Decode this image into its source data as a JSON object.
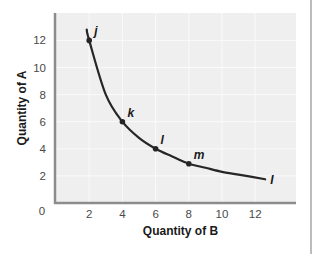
{
  "chart_data": {
    "type": "line",
    "title": "",
    "xlabel": "Quantity of B",
    "ylabel": "Quantity of A",
    "xlim": [
      0,
      14.5
    ],
    "ylim": [
      0,
      14
    ],
    "xticks": [
      2,
      4,
      6,
      8,
      10,
      12
    ],
    "xtick_labels": [
      "2",
      "4",
      "6",
      "8",
      "10",
      "12"
    ],
    "yticks": [
      2,
      4,
      6,
      8,
      10,
      12
    ],
    "ytick_labels": [
      "2",
      "4",
      "6",
      "8",
      "10",
      "12"
    ],
    "origin_label": "0",
    "grid": true,
    "series": [
      {
        "name": "I",
        "curve_label": "I",
        "x": [
          1.85,
          2,
          3,
          4,
          5,
          6,
          7,
          8,
          9,
          10,
          11,
          12.6
        ],
        "y": [
          12.8,
          12,
          8,
          6,
          4.8,
          4,
          3.43,
          2.9,
          2.6,
          2.3,
          2.1,
          1.75
        ]
      }
    ],
    "points": [
      {
        "label": "j",
        "x": 2,
        "y": 12
      },
      {
        "label": "k",
        "x": 4,
        "y": 6
      },
      {
        "label": "l",
        "x": 6,
        "y": 4
      },
      {
        "label": "m",
        "x": 8,
        "y": 2.9
      }
    ],
    "colors": {
      "plot_background": "#efefef",
      "grid": "#fafafa",
      "axis": "#8c8c8c",
      "curve": "#262626"
    }
  }
}
